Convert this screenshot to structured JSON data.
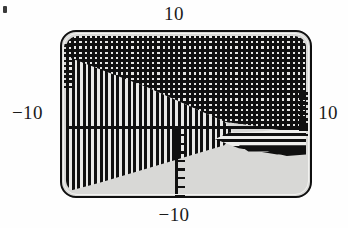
{
  "figure": {
    "kind": "region-plot",
    "background_color": "#d8d8d6",
    "ink_color": "#101010",
    "page_color": "#fefefe"
  },
  "labels": {
    "top": "10",
    "bottom": "−10",
    "left": "−10",
    "right": "10"
  },
  "chart_data": {
    "type": "heatmap",
    "title": "",
    "xlabel": "",
    "ylabel": "",
    "xlim": [
      -10,
      10
    ],
    "ylim": [
      -10,
      10
    ],
    "xticklabels": [
      "−10",
      "10"
    ],
    "yticklabels": [
      "−10",
      "10"
    ],
    "grid": false,
    "legend": "none",
    "axes": {
      "x_axis_at_y": 0,
      "y_axis_at_x": 0,
      "x_axis_drawn": true,
      "y_axis_drawn": true,
      "y_axis_visible_range": [
        -10,
        0
      ]
    },
    "fills": [
      {
        "name": "dotted-region",
        "pattern": "dot-grid",
        "color": "#101010",
        "description": "checkered dot mesh occupying the upper band, boundary slopes down-left from upper-right toward the left edge"
      },
      {
        "name": "vertical-stripe-region",
        "pattern": "vertical-hatch",
        "color": "#101010",
        "description": "vertical line hatching forming a wedge that narrows from the left edge toward the origin"
      },
      {
        "name": "horizontal-stripe-region",
        "pattern": "horizontal-hatch",
        "color": "#101010",
        "description": "horizontal line hatching in a wedge along the right edge just above the x axis"
      },
      {
        "name": "empty-region",
        "pattern": "solid",
        "color": "#d8d8d6",
        "description": "unshaded light-gray region filling the lower-right quadrant below the boundary"
      }
    ],
    "ticks": {
      "y_axis_below_origin": 8,
      "x_axis_left_edge": 9,
      "x_axis_right_edge": 9
    }
  },
  "artifacts": {
    "speck": "scan-speck"
  }
}
